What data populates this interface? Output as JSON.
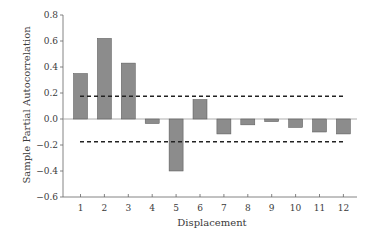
{
  "chart_data": {
    "type": "bar",
    "title": "",
    "xlabel": "Displacement",
    "ylabel": "Sample Partial Autocorrelation",
    "categories": [
      "1",
      "2",
      "3",
      "4",
      "5",
      "6",
      "7",
      "8",
      "9",
      "10",
      "11",
      "12"
    ],
    "values": [
      0.35,
      0.62,
      0.43,
      -0.035,
      -0.4,
      0.15,
      -0.115,
      -0.045,
      -0.02,
      -0.065,
      -0.1,
      -0.115
    ],
    "ylim": [
      -0.6,
      0.8
    ],
    "yticks": [
      "0.8",
      "0.6",
      "0.4",
      "0.2",
      "0.0",
      "−0.2",
      "−0.4",
      "−0.6"
    ],
    "ytick_values": [
      0.8,
      0.6,
      0.4,
      0.2,
      0.0,
      -0.2,
      -0.4,
      -0.6
    ],
    "confidence_bounds": [
      0.175,
      -0.175
    ],
    "grid": false,
    "legend": null,
    "bar_color": "#8c8c8c",
    "bar_edge_color": "#555555",
    "bound_line_style": "dashed"
  }
}
